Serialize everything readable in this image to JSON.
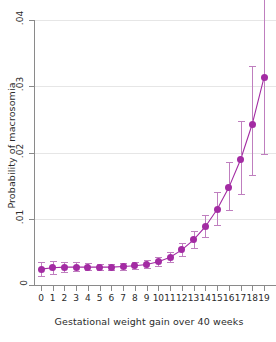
{
  "chart_data": {
    "type": "line",
    "title": "",
    "subtitle": "",
    "xlabel": "Gestational weight gain over 40 weeks",
    "ylabel": "Probability of macrosomia",
    "xlim": [
      -0.5,
      19.5
    ],
    "ylim": [
      0,
      0.04
    ],
    "grid": "horizontal",
    "legend": "none",
    "series_color": "#a32ba3",
    "errorbar_color": "#bf7fbf",
    "marker": "circle",
    "errorbars": "95% confidence interval",
    "x": [
      0,
      1,
      2,
      3,
      4,
      5,
      6,
      7,
      8,
      9,
      10,
      11,
      12,
      13,
      14,
      15,
      16,
      17,
      18,
      19
    ],
    "values": [
      0.0024,
      0.0026,
      0.0027,
      0.0027,
      0.0027,
      0.0027,
      0.0027,
      0.0028,
      0.0029,
      0.0031,
      0.0035,
      0.0042,
      0.0053,
      0.0068,
      0.0088,
      0.0114,
      0.0147,
      0.0189,
      0.0243,
      0.0313
    ],
    "ci_low": [
      0.0013,
      0.0017,
      0.002,
      0.0021,
      0.0022,
      0.0022,
      0.0022,
      0.0023,
      0.0024,
      0.0026,
      0.0029,
      0.0035,
      0.0044,
      0.0056,
      0.0072,
      0.0091,
      0.0113,
      0.0138,
      0.0166,
      0.0198
    ],
    "ci_high": [
      0.0035,
      0.0036,
      0.0035,
      0.0034,
      0.0033,
      0.0032,
      0.0032,
      0.0033,
      0.0035,
      0.0037,
      0.0042,
      0.005,
      0.0063,
      0.0081,
      0.0106,
      0.014,
      0.0186,
      0.0248,
      0.033,
      0.0437
    ],
    "y_ticks": [
      0,
      0.01,
      0.02,
      0.03,
      0.04
    ],
    "y_tick_labels": [
      "0",
      ".01",
      ".02",
      ".03",
      ".04"
    ],
    "x_ticks": [
      0,
      1,
      2,
      3,
      4,
      5,
      6,
      7,
      8,
      9,
      10,
      11,
      12,
      13,
      14,
      15,
      16,
      17,
      18,
      19
    ],
    "x_tick_labels": [
      "0",
      "1",
      "2",
      "3",
      "4",
      "5",
      "6",
      "7",
      "8",
      "9",
      "10",
      "11",
      "12",
      "13",
      "14",
      "15",
      "16",
      "17",
      "18",
      "19"
    ]
  }
}
